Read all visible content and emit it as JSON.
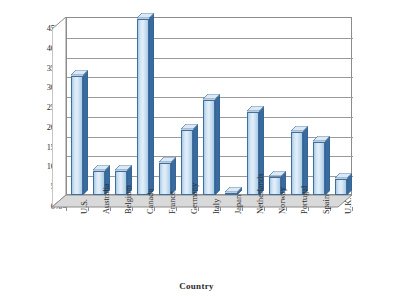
{
  "chart_data": {
    "type": "bar",
    "title": "",
    "xlabel": "Country",
    "ylabel": "Percent of venture capital funds",
    "categories": [
      "U.S.",
      "Australia",
      "Belgium",
      "Canada",
      "France",
      "Germany",
      "Italy",
      "Japan",
      "Netherlands",
      "Norway",
      "Portugal",
      "Spain",
      "U.K."
    ],
    "values": [
      30,
      6,
      6,
      44.5,
      8,
      16.5,
      24,
      0.5,
      21,
      4.5,
      16,
      13.5,
      4
    ],
    "ylim": [
      0,
      45
    ],
    "ytick_labels": [
      "0%",
      "5%",
      "10%",
      "15%",
      "20%",
      "25%",
      "30%",
      "35%",
      "40%",
      "45%"
    ],
    "ytick_values": [
      0,
      5,
      10,
      15,
      20,
      25,
      30,
      35,
      40,
      45
    ],
    "grid": true,
    "legend": false,
    "series": [
      {
        "name": "Percent of venture capital funds",
        "values": [
          30,
          6,
          6,
          44.5,
          8,
          16.5,
          24,
          0.5,
          21,
          4.5,
          16,
          13.5,
          4
        ]
      }
    ]
  },
  "axis": {
    "y_title_line1": "Percent of venture",
    "y_title_line2": "capital funds",
    "x_title": "Country"
  },
  "colors": {
    "bar_face_light": "#e4f0fa",
    "bar_face_mid": "#cfe3f4",
    "bar_edge": "#3e6f9e",
    "bar_side": "#3a6b9e",
    "bar_top": "#dce9f5",
    "gridline": "#9a9a9a",
    "axis": "#8c8c8c",
    "floor": "#d9d9d9",
    "text": "#2b2b2b",
    "background": "#ffffff"
  }
}
